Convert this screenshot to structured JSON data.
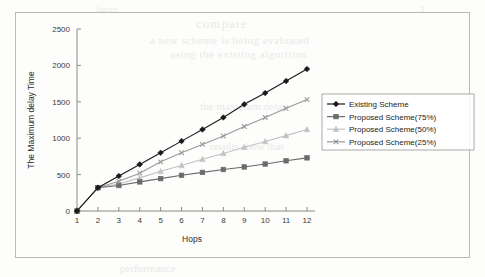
{
  "chart_data": {
    "type": "line",
    "title": "",
    "xlabel": "Hops",
    "ylabel": "The Maximum delay Time",
    "x": [
      1,
      2,
      3,
      4,
      5,
      6,
      7,
      8,
      9,
      10,
      11,
      12
    ],
    "xticklabels": [
      "1",
      "2",
      "3",
      "4",
      "5",
      "6",
      "7",
      "8",
      "9",
      "10",
      "11",
      "12"
    ],
    "yticks": [
      0,
      500,
      1000,
      1500,
      2000,
      2500
    ],
    "yticklabels": [
      "0",
      "500",
      "1000",
      "1500",
      "2000",
      "2500"
    ],
    "xlim": [
      1,
      12
    ],
    "ylim": [
      0,
      2500
    ],
    "grid": false,
    "legend_position": "upper right inside",
    "series": [
      {
        "name": "Existing Scheme",
        "marker": "diamond",
        "color": "#1a1a1a",
        "values": [
          0,
          320,
          480,
          640,
          800,
          960,
          1120,
          1285,
          1465,
          1620,
          1785,
          1950
        ]
      },
      {
        "name": "Proposed Scheme(75%)",
        "marker": "square",
        "color": "#6b6b6b",
        "values": [
          0,
          320,
          350,
          400,
          445,
          490,
          530,
          570,
          605,
          645,
          690,
          730
        ]
      },
      {
        "name": "Proposed Scheme(50%)",
        "marker": "triangle",
        "color": "#c2c2c2",
        "values": [
          0,
          320,
          370,
          455,
          545,
          625,
          710,
          790,
          875,
          955,
          1035,
          1120
        ]
      },
      {
        "name": "Proposed Scheme(25%)",
        "marker": "cross",
        "color": "#9a9a9a",
        "values": [
          0,
          320,
          410,
          520,
          675,
          800,
          915,
          1030,
          1160,
          1285,
          1410,
          1530
        ]
      }
    ]
  },
  "bleed_text": {
    "line1": "compare",
    "line2": "a new scheme is being evaluated",
    "line3": "using the existing algorithm",
    "line4": "the maximum delay",
    "line5": "results show that",
    "line6": "performance",
    "line7": "figure",
    "line8": "2"
  }
}
